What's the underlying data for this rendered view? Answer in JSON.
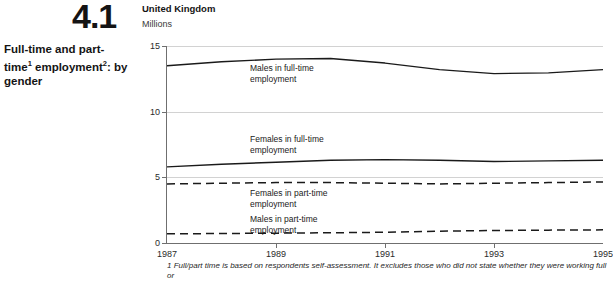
{
  "figure": {
    "number": "4.1",
    "title_line1": "Full-time and part-time",
    "title_sup1": "1",
    "title_line2": "employment",
    "title_sup2": "2",
    "title_line2_tail": ": by gender"
  },
  "chart_header": {
    "country": "United Kingdom",
    "units": "Millions"
  },
  "labels": {
    "males_full_time": "Males in full-time\nemployment",
    "females_full_time": "Females in full-time\nemployment",
    "females_part_time": "Females in part-time\nemployment",
    "males_part_time": "Males in part-time\nemployment"
  },
  "footnote": "1  Full/part time is based on respondents self-assessment. It excludes those who did not state whether they were working full or",
  "colors": {
    "line": "#1a1a1a",
    "grid": "#d2d2d2",
    "axis": "#6f6f6f"
  },
  "chart_data": {
    "type": "line",
    "subtitle": "United Kingdom",
    "xlabel": "",
    "ylabel": "Millions",
    "xlim": [
      1987,
      1995
    ],
    "ylim": [
      0,
      15
    ],
    "yticks": [
      0,
      5,
      10,
      15
    ],
    "xticks": [
      1987,
      1989,
      1991,
      1993,
      1995
    ],
    "xtick_labels": [
      "1987",
      "1989",
      "1991",
      "1993",
      "1995"
    ],
    "ytick_labels": [
      "0",
      "5",
      "10",
      "15"
    ],
    "grid": true,
    "legend": "in-plot annotations",
    "x": [
      1987,
      1988,
      1989,
      1990,
      1991,
      1992,
      1993,
      1994,
      1995
    ],
    "series": [
      {
        "name": "Males in full-time employment",
        "style": "solid",
        "values": [
          13.5,
          13.8,
          14.0,
          14.05,
          13.7,
          13.2,
          12.9,
          12.95,
          13.2
        ]
      },
      {
        "name": "Females in full-time employment",
        "style": "solid",
        "values": [
          5.8,
          6.0,
          6.15,
          6.3,
          6.35,
          6.3,
          6.2,
          6.25,
          6.3
        ]
      },
      {
        "name": "Females in part-time employment",
        "style": "dashed",
        "values": [
          4.5,
          4.55,
          4.6,
          4.6,
          4.55,
          4.5,
          4.55,
          4.6,
          4.65
        ]
      },
      {
        "name": "Males in part-time employment",
        "style": "dashed",
        "values": [
          0.7,
          0.72,
          0.75,
          0.78,
          0.82,
          0.9,
          0.95,
          0.98,
          1.0
        ]
      }
    ]
  }
}
